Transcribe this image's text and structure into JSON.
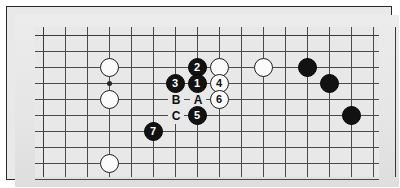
{
  "diagram": {
    "kind": "go-board-joseki-diagram",
    "background_color": "#e8e8e8",
    "frame_color": "#2a2a2a",
    "line_color": "#4a4a4a",
    "black_color": "#121212",
    "white_color": "#fbfbfb",
    "grid": {
      "columns": 16,
      "rows": 10,
      "cell_width": 22,
      "cell_height": 16,
      "origin_x": 8,
      "origin_y": 8
    },
    "star_points": [
      {
        "col": 3,
        "row": 3
      }
    ],
    "stones": [
      {
        "col": 3,
        "row": 2,
        "color": "white",
        "label": ""
      },
      {
        "col": 3,
        "row": 4,
        "color": "white",
        "label": ""
      },
      {
        "col": 3,
        "row": 8,
        "color": "white",
        "label": ""
      },
      {
        "col": 7,
        "row": 2,
        "color": "black",
        "label": "2"
      },
      {
        "col": 8,
        "row": 2,
        "color": "white",
        "label": ""
      },
      {
        "col": 6,
        "row": 3,
        "color": "black",
        "label": "3"
      },
      {
        "col": 7,
        "row": 3,
        "color": "black",
        "label": "1"
      },
      {
        "col": 8,
        "row": 3,
        "color": "white",
        "label": "4"
      },
      {
        "col": 8,
        "row": 4,
        "color": "white",
        "label": "6"
      },
      {
        "col": 7,
        "row": 5,
        "color": "black",
        "label": "5"
      },
      {
        "col": 5,
        "row": 6,
        "color": "black",
        "label": "7"
      },
      {
        "col": 10,
        "row": 2,
        "color": "white",
        "label": ""
      },
      {
        "col": 12,
        "row": 2,
        "color": "black",
        "label": ""
      },
      {
        "col": 13,
        "row": 3,
        "color": "black",
        "label": ""
      },
      {
        "col": 14,
        "row": 5,
        "color": "black",
        "label": ""
      }
    ],
    "markers": [
      {
        "col": 7,
        "row": 4,
        "text": "A"
      },
      {
        "col": 6,
        "row": 4,
        "text": "B"
      },
      {
        "col": 6,
        "row": 5,
        "text": "C"
      }
    ]
  }
}
